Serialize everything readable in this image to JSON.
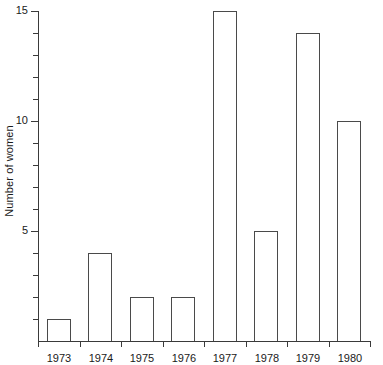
{
  "chart_data": {
    "type": "bar",
    "title": "",
    "subtitle": "",
    "xlabel": "",
    "ylabel": "Number of women",
    "categories": [
      "1973",
      "1974",
      "1975",
      "1976",
      "1977",
      "1978",
      "1979",
      "1980"
    ],
    "values": [
      1,
      4,
      2,
      2,
      15,
      5,
      14,
      10
    ],
    "ylim": [
      0,
      15
    ],
    "xlim_note": "categorical, 8 equal slots",
    "y_major_ticks": [
      5,
      10,
      15
    ],
    "y_major_tick_labels": [
      "5",
      "10",
      "15"
    ],
    "y_minor_ticks": [
      1,
      2,
      3,
      4,
      6,
      7,
      8,
      9,
      11,
      12,
      13,
      14
    ],
    "grid": false,
    "legend": "none",
    "bar_style": {
      "fill": "#ffffff",
      "edge": "#4a4a4a"
    },
    "axis_color": "#3a3a3a",
    "background": "#ffffff"
  }
}
